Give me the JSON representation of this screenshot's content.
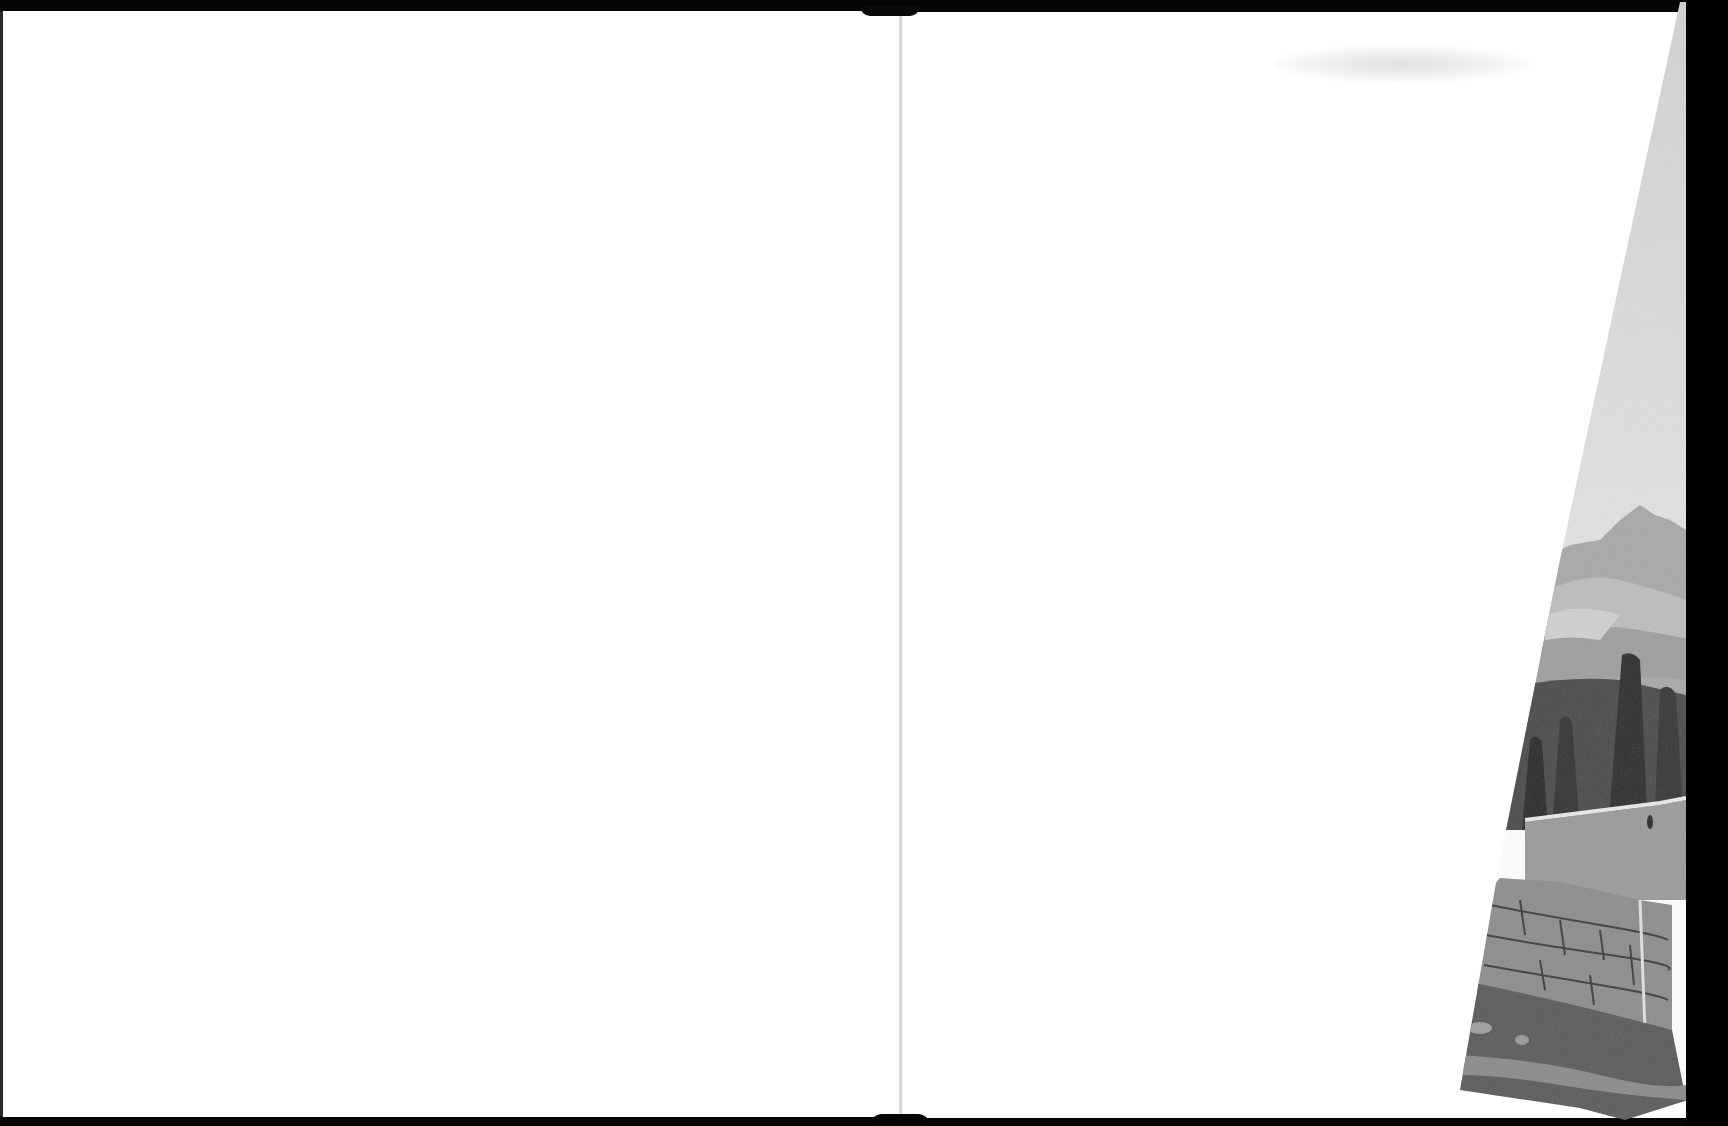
{
  "document": {
    "type": "scanned-book-spread",
    "left_page": {
      "content": ""
    },
    "right_page": {
      "content": "",
      "folded_plate": {
        "subject": "landscape engraving: mountains, cypress trees, stone farmhouse and wall",
        "tone": "grayscale"
      }
    }
  },
  "colors": {
    "frame": "#000000",
    "paper": "#ffffff",
    "gutter": "#d0d0d0",
    "plate_sky": "#d6d6d6",
    "plate_mountain": "#9a9a9a",
    "plate_trees": "#3a3a3a",
    "plate_wall": "#8e8e8e"
  }
}
